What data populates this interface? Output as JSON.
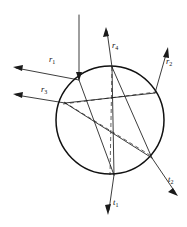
{
  "figure": {
    "background_color": "#ffffff",
    "line_color": "#1a1a1a",
    "circle_color": "#111111",
    "dashed_color": "#3a3a3a",
    "width": 187,
    "height": 227
  },
  "circle": {
    "name": "droplet-boundary",
    "center_x": 110,
    "center_y": 120,
    "radius": 54
  },
  "labels": {
    "r1": {
      "text": "r",
      "sub": "1",
      "x": 49,
      "y": 62
    },
    "r2": {
      "text": "r",
      "sub": "2",
      "x": 166,
      "y": 64
    },
    "r3": {
      "text": "r",
      "sub": "3",
      "x": 41,
      "y": 92
    },
    "r4": {
      "text": "r",
      "sub": "4",
      "x": 112,
      "y": 48
    },
    "t1": {
      "text": "t",
      "sub": "1",
      "x": 113,
      "y": 205
    },
    "t2": {
      "text": "t",
      "sub": "2",
      "x": 168,
      "y": 182
    }
  },
  "rays": {
    "incident": {
      "name": "incident-ray",
      "x1": 79,
      "y1": 15,
      "x2": 79,
      "y2": 80
    },
    "r1": {
      "name": "reflected-ray-r1",
      "x1": 79,
      "y1": 80,
      "x2": 14,
      "y2": 68
    },
    "r3": {
      "name": "reflected-ray-r3",
      "x1": 65,
      "y1": 103,
      "x2": 13,
      "y2": 95
    },
    "r4": {
      "name": "reflected-ray-r4",
      "x1": 112,
      "y1": 67,
      "x2": 106,
      "y2": 28
    },
    "r2": {
      "name": "reflected-ray-r2",
      "x1": 155,
      "y1": 93,
      "x2": 168,
      "y2": 48
    },
    "t1": {
      "name": "transmitted-ray-t1",
      "x1": 114,
      "y1": 175,
      "x2": 108,
      "y2": 214
    },
    "t2": {
      "name": "transmitted-ray-t2",
      "x1": 152,
      "y1": 158,
      "x2": 178,
      "y2": 196
    }
  },
  "internal_chords": [
    {
      "name": "chord-entry-to-bottom",
      "x1": 79,
      "y1": 80,
      "x2": 114,
      "y2": 175
    },
    {
      "name": "chord-entry-to-right",
      "x1": 65,
      "y1": 103,
      "x2": 155,
      "y2": 93
    },
    {
      "name": "chord-bottom-to-top",
      "x1": 114,
      "y1": 175,
      "x2": 112,
      "y2": 67
    },
    {
      "name": "chord-left-to-lowerright",
      "x1": 65,
      "y1": 103,
      "x2": 152,
      "y2": 158
    },
    {
      "name": "chord-top-to-lowerright",
      "x1": 112,
      "y1": 67,
      "x2": 152,
      "y2": 158
    }
  ],
  "normals": [
    {
      "name": "normal-line-entry",
      "x1": 63,
      "y1": 104,
      "x2": 156,
      "y2": 92
    },
    {
      "name": "normal-line-top",
      "x1": 112,
      "y1": 67,
      "x2": 110,
      "y2": 175
    },
    {
      "name": "normal-line-diagonal",
      "x1": 64,
      "y1": 102,
      "x2": 153,
      "y2": 157
    }
  ]
}
